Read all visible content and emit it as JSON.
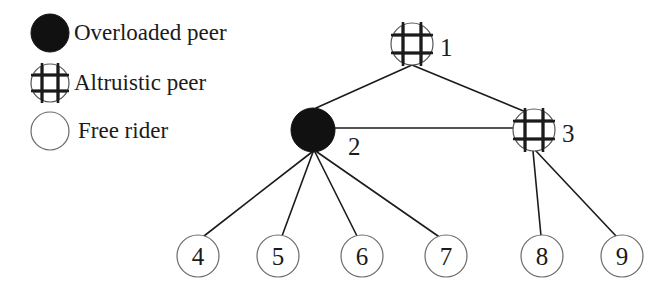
{
  "figure": {
    "background_color": "#ffffff",
    "stroke_color": "#1b1b1b",
    "fill_overloaded": "#111111",
    "fill_free_rider": "#ffffff",
    "fill_altruistic": "#ffffff"
  },
  "legend": {
    "items": [
      {
        "id": "overloaded",
        "label": "Overloaded peer",
        "icon": "filled-circle-icon",
        "icon_cx": 50,
        "icon_cy": 33,
        "icon_r": 19,
        "text_x": 74,
        "text_y": 23
      },
      {
        "id": "altruistic",
        "label": "Altruistic peer",
        "icon": "crosshatch-circle-icon",
        "icon_cx": 50,
        "icon_cy": 83,
        "icon_r": 19,
        "text_x": 74,
        "text_y": 73
      },
      {
        "id": "free-rider",
        "label": "Free rider",
        "icon": "empty-circle-icon",
        "icon_cx": 50,
        "icon_cy": 131,
        "icon_r": 19,
        "text_x": 78,
        "text_y": 121
      }
    ]
  },
  "graph": {
    "nodes": [
      {
        "id": "1",
        "label": "1",
        "type": "altruistic",
        "cx": 412,
        "cy": 44,
        "r": 21,
        "label_x": 440,
        "label_y": 46,
        "label_inside": false
      },
      {
        "id": "2",
        "label": "2",
        "type": "overloaded",
        "cx": 313,
        "cy": 130,
        "r": 22,
        "label_x": 348,
        "label_y": 144,
        "label_inside": false
      },
      {
        "id": "3",
        "label": "3",
        "type": "altruistic",
        "cx": 534,
        "cy": 130,
        "r": 21,
        "label_x": 562,
        "label_y": 132,
        "label_inside": false
      },
      {
        "id": "4",
        "label": "4",
        "type": "free-rider",
        "cx": 198,
        "cy": 256,
        "r": 21,
        "label_inside": true
      },
      {
        "id": "5",
        "label": "5",
        "type": "free-rider",
        "cx": 278,
        "cy": 256,
        "r": 21,
        "label_inside": true
      },
      {
        "id": "6",
        "label": "6",
        "type": "free-rider",
        "cx": 362,
        "cy": 256,
        "r": 21,
        "label_inside": true
      },
      {
        "id": "7",
        "label": "7",
        "type": "free-rider",
        "cx": 446,
        "cy": 256,
        "r": 21,
        "label_inside": true
      },
      {
        "id": "8",
        "label": "8",
        "type": "free-rider",
        "cx": 542,
        "cy": 256,
        "r": 21,
        "label_inside": true
      },
      {
        "id": "9",
        "label": "9",
        "type": "free-rider",
        "cx": 622,
        "cy": 256,
        "r": 21,
        "label_inside": true
      }
    ],
    "edges": [
      {
        "from": "1",
        "to": "2",
        "x1": 412,
        "y1": 65,
        "x2": 316,
        "y2": 108
      },
      {
        "from": "1",
        "to": "3",
        "x1": 412,
        "y1": 65,
        "x2": 526,
        "y2": 112
      },
      {
        "from": "2",
        "to": "3",
        "x1": 334,
        "y1": 128,
        "x2": 513,
        "y2": 128
      },
      {
        "from": "2",
        "to": "4",
        "x1": 312,
        "y1": 152,
        "x2": 204,
        "y2": 236
      },
      {
        "from": "2",
        "to": "5",
        "x1": 313,
        "y1": 152,
        "x2": 282,
        "y2": 236
      },
      {
        "from": "2",
        "to": "6",
        "x1": 315,
        "y1": 152,
        "x2": 357,
        "y2": 236
      },
      {
        "from": "2",
        "to": "7",
        "x1": 317,
        "y1": 152,
        "x2": 438,
        "y2": 236
      },
      {
        "from": "3",
        "to": "8",
        "x1": 533,
        "y1": 151,
        "x2": 541,
        "y2": 236
      },
      {
        "from": "3",
        "to": "9",
        "x1": 536,
        "y1": 151,
        "x2": 616,
        "y2": 236
      }
    ]
  }
}
